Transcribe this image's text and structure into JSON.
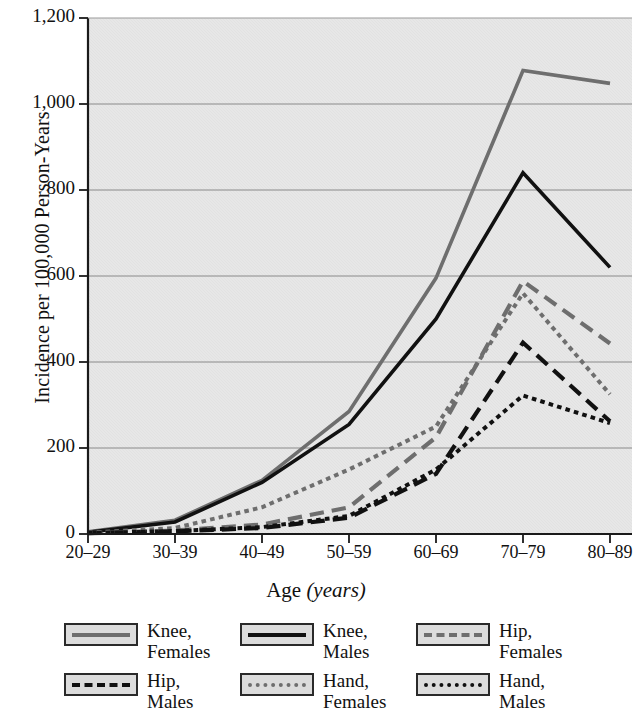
{
  "chart_data": {
    "type": "line",
    "title": "",
    "xlabel_plain": "Age ",
    "xlabel_italic": "(years)",
    "ylabel": "Incidence per 100,000 Person-Years",
    "categories": [
      "20–29",
      "30–39",
      "40–49",
      "50–59",
      "60–69",
      "70–79",
      "80–89"
    ],
    "ytick_labels": [
      "0",
      "200",
      "400",
      "600",
      "800",
      "1,000",
      "1,200"
    ],
    "ytick_values": [
      0,
      200,
      400,
      600,
      800,
      1000,
      1200
    ],
    "ylim": [
      0,
      1200
    ],
    "grid": "horizontal",
    "legend_position": "bottom",
    "series": [
      {
        "name": "Knee, Females",
        "label_line1": "Knee,",
        "label_line2": "Females",
        "color": "#6e6e6e",
        "style": "solid",
        "width": 3.6,
        "values": [
          5,
          32,
          125,
          285,
          595,
          1078,
          1048
        ]
      },
      {
        "name": "Knee, Males",
        "label_line1": "Knee,",
        "label_line2": "Males",
        "color": "#111111",
        "style": "solid",
        "width": 3.6,
        "values": [
          4,
          28,
          120,
          255,
          500,
          840,
          620
        ]
      },
      {
        "name": "Hip, Females",
        "label_line1": "Hip,",
        "label_line2": "Females",
        "color": "#6e6e6e",
        "style": "dashed",
        "width": 4.2,
        "values": [
          2,
          8,
          22,
          62,
          225,
          588,
          443
        ]
      },
      {
        "name": "Hip, Males",
        "label_line1": "Hip,",
        "label_line2": "Males",
        "color": "#111111",
        "style": "dashed",
        "width": 4.2,
        "values": [
          2,
          6,
          14,
          38,
          140,
          445,
          262
        ]
      },
      {
        "name": "Hand, Females",
        "label_line1": "Hand,",
        "label_line2": "Females",
        "color": "#6e6e6e",
        "style": "dotted",
        "width": 4.0,
        "values": [
          3,
          14,
          62,
          150,
          250,
          560,
          325
        ]
      },
      {
        "name": "Hand, Males",
        "label_line1": "Hand,",
        "label_line2": "Males",
        "color": "#111111",
        "style": "dotted",
        "width": 4.0,
        "values": [
          2,
          7,
          16,
          42,
          150,
          322,
          258
        ]
      }
    ],
    "colors": {
      "plot_background": "#e2e2e2",
      "gridline": "#8a8a8a",
      "axis": "#1a1a1a",
      "gray_series": "#6e6e6e",
      "black_series": "#111111"
    }
  }
}
